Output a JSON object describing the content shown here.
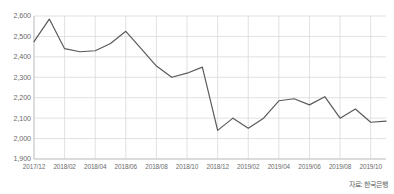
{
  "source_note": "자료: 한국은행",
  "chart_data": {
    "type": "line",
    "title": "",
    "xlabel": "",
    "ylabel": "",
    "grid": true,
    "legend": "none",
    "line_color": "#5a5a5a",
    "grid_color": "#d9d9d9",
    "axis_color": "#c8c8c8",
    "tick_label_color": "#6b6b6b",
    "ylim": [
      1900,
      2600
    ],
    "yticks": [
      2600,
      2500,
      2400,
      2300,
      2200,
      2100,
      2000,
      1900
    ],
    "ytick_labels": [
      "2,600",
      "2,500",
      "2,400",
      "2,300",
      "2,200",
      "2,100",
      "2,000",
      "1,900"
    ],
    "xtick_labels": [
      "2017/12",
      "2018/02",
      "2018/04",
      "2018/06",
      "2018/08",
      "2018/10",
      "2018/12",
      "2019/02",
      "2019/04",
      "2019/06",
      "2019/08",
      "2019/10"
    ],
    "x": [
      "2017/12",
      "2018/01",
      "2018/02",
      "2018/03",
      "2018/04",
      "2018/05",
      "2018/06",
      "2018/07",
      "2018/08",
      "2018/09",
      "2018/10",
      "2018/11",
      "2018/12",
      "2019/01",
      "2019/02",
      "2019/03",
      "2019/04",
      "2019/05",
      "2019/06",
      "2019/07",
      "2019/08",
      "2019/09",
      "2019/10",
      "2019/11"
    ],
    "values": [
      2475,
      2585,
      2440,
      2425,
      2430,
      2465,
      2525,
      2440,
      2355,
      2300,
      2320,
      2350,
      2040,
      2100,
      2050,
      2100,
      2185,
      2195,
      2165,
      2205,
      2100,
      2145,
      2080,
      2085
    ],
    "values_min": 2040,
    "values_max": 2585
  }
}
